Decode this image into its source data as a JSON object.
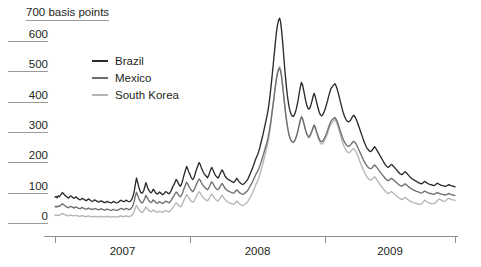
{
  "chart_data": {
    "type": "line",
    "title": "700 basis points",
    "xlabel": "",
    "ylabel": "basis points",
    "unit_label": "700 basis points",
    "ylim": [
      0,
      700
    ],
    "yticks": [
      0,
      100,
      200,
      300,
      400,
      500,
      600
    ],
    "ytick_labels": [
      "0",
      "100",
      "200",
      "300",
      "400",
      "500",
      "600"
    ],
    "grid": false,
    "legend_position": "upper-left-inside",
    "xlim": [
      "2006-01",
      "2009-12"
    ],
    "xticks": [
      "2007",
      "2008",
      "2009"
    ],
    "xtick_labels": [
      "2007",
      "2008",
      "2009"
    ],
    "x_boundaries": [
      "2006-01",
      "2007-01",
      "2008-01",
      "2009-01",
      "2009-12"
    ],
    "series": [
      {
        "name": "Brazil",
        "color": "#2b2b2b",
        "values": [
          82,
          84,
          80,
          86,
          83,
          88,
          92,
          97,
          94,
          90,
          86,
          84,
          81,
          79,
          83,
          86,
          84,
          81,
          78,
          80,
          83,
          80,
          77,
          75,
          73,
          75,
          78,
          76,
          74,
          72,
          70,
          73,
          76,
          74,
          71,
          69,
          68,
          70,
          73,
          71,
          69,
          67,
          66,
          68,
          70,
          68,
          66,
          65,
          64,
          66,
          68,
          66,
          65,
          64,
          63,
          65,
          68,
          66,
          64,
          63,
          64,
          66,
          69,
          72,
          70,
          68,
          67,
          69,
          72,
          70,
          68,
          67,
          68,
          72,
          78,
          88,
          104,
          126,
          145,
          133,
          118,
          106,
          98,
          95,
          97,
          104,
          116,
          130,
          120,
          110,
          104,
          99,
          96,
          100,
          108,
          104,
          98,
          94,
          92,
          95,
          99,
          96,
          93,
          90,
          92,
          96,
          100,
          98,
          95,
          93,
          96,
          102,
          110,
          118,
          124,
          132,
          140,
          136,
          128,
          122,
          118,
          124,
          134,
          148,
          160,
          172,
          183,
          176,
          166,
          158,
          150,
          144,
          140,
          146,
          156,
          168,
          178,
          188,
          196,
          190,
          180,
          172,
          164,
          158,
          154,
          150,
          146,
          152,
          162,
          172,
          180,
          174,
          166,
          158,
          152,
          148,
          145,
          150,
          158,
          166,
          172,
          166,
          158,
          150,
          146,
          142,
          140,
          138,
          136,
          134,
          132,
          130,
          133,
          138,
          144,
          140,
          134,
          130,
          127,
          125,
          124,
          126,
          130,
          134,
          138,
          144,
          152,
          160,
          168,
          176,
          186,
          196,
          206,
          214,
          222,
          232,
          244,
          258,
          272,
          286,
          302,
          318,
          334,
          350,
          368,
          392,
          420,
          452,
          486,
          520,
          556,
          592,
          624,
          648,
          664,
          672,
          660,
          630,
          592,
          548,
          504,
          466,
          432,
          404,
          382,
          366,
          356,
          350,
          348,
          352,
          360,
          372,
          388,
          406,
          428,
          446,
          460,
          452,
          436,
          418,
          400,
          386,
          376,
          372,
          376,
          386,
          398,
          412,
          424,
          416,
          402,
          388,
          374,
          362,
          354,
          350,
          352,
          358,
          366,
          376,
          388,
          400,
          414,
          426,
          438,
          444,
          448,
          452,
          456,
          450,
          440,
          428,
          414,
          400,
          386,
          372,
          360,
          350,
          342,
          336,
          332,
          330,
          332,
          336,
          342,
          348,
          352,
          348,
          342,
          334,
          324,
          314,
          304,
          294,
          284,
          274,
          264,
          256,
          248,
          242,
          238,
          234,
          232,
          234,
          238,
          244,
          248,
          244,
          238,
          232,
          226,
          220,
          214,
          208,
          202,
          196,
          190,
          186,
          182,
          180,
          182,
          186,
          190,
          188,
          184,
          180,
          176,
          172,
          168,
          164,
          160,
          158,
          156,
          158,
          162,
          166,
          164,
          160,
          156,
          152,
          148,
          145,
          142,
          140,
          138,
          136,
          134,
          132,
          130,
          128,
          127,
          126,
          128,
          131,
          134,
          132,
          129,
          127,
          125,
          124,
          123,
          122,
          121,
          120,
          122,
          125,
          128,
          126,
          124,
          122,
          121,
          120,
          119,
          118,
          118,
          119,
          121,
          123,
          122,
          120,
          119,
          118,
          117,
          116
        ]
      },
      {
        "name": "Mexico",
        "color": "#6e6e6e",
        "values": [
          50,
          52,
          49,
          53,
          51,
          54,
          57,
          60,
          58,
          55,
          52,
          50,
          48,
          47,
          50,
          52,
          50,
          48,
          46,
          48,
          50,
          48,
          46,
          45,
          44,
          46,
          48,
          46,
          44,
          43,
          42,
          44,
          46,
          44,
          43,
          42,
          41,
          43,
          45,
          43,
          42,
          41,
          40,
          42,
          44,
          42,
          41,
          40,
          39,
          41,
          43,
          41,
          40,
          39,
          38,
          40,
          42,
          40,
          39,
          38,
          39,
          41,
          43,
          45,
          44,
          42,
          41,
          43,
          45,
          44,
          42,
          41,
          42,
          45,
          50,
          58,
          70,
          86,
          98,
          90,
          80,
          72,
          66,
          63,
          64,
          70,
          78,
          88,
          82,
          75,
          70,
          66,
          64,
          67,
          73,
          70,
          66,
          63,
          62,
          64,
          67,
          65,
          63,
          61,
          63,
          66,
          69,
          67,
          65,
          63,
          66,
          70,
          76,
          82,
          87,
          93,
          99,
          96,
          90,
          86,
          83,
          88,
          95,
          105,
          114,
          123,
          131,
          126,
          119,
          113,
          107,
          103,
          100,
          105,
          112,
          121,
          129,
          136,
          142,
          138,
          131,
          125,
          119,
          115,
          112,
          109,
          106,
          111,
          118,
          126,
          132,
          128,
          122,
          116,
          111,
          108,
          106,
          110,
          116,
          122,
          127,
          122,
          116,
          110,
          107,
          104,
          102,
          100,
          99,
          97,
          96,
          95,
          98,
          102,
          106,
          103,
          99,
          96,
          94,
          92,
          91,
          93,
          96,
          99,
          102,
          107,
          113,
          119,
          125,
          131,
          139,
          147,
          155,
          161,
          167,
          175,
          184,
          194,
          205,
          216,
          228,
          240,
          252,
          264,
          278,
          296,
          317,
          341,
          367,
          393,
          420,
          447,
          471,
          490,
          501,
          507,
          498,
          476,
          447,
          414,
          381,
          352,
          326,
          305,
          288,
          276,
          269,
          264,
          263,
          266,
          272,
          281,
          293,
          307,
          323,
          337,
          347,
          341,
          329,
          316,
          302,
          292,
          284,
          281,
          284,
          292,
          301,
          311,
          320,
          314,
          304,
          293,
          283,
          274,
          268,
          265,
          266,
          271,
          277,
          284,
          293,
          302,
          313,
          322,
          331,
          336,
          339,
          342,
          345,
          340,
          333,
          324,
          313,
          302,
          292,
          281,
          272,
          265,
          259,
          254,
          251,
          249,
          251,
          254,
          259,
          263,
          266,
          263,
          259,
          253,
          245,
          237,
          230,
          222,
          215,
          207,
          200,
          194,
          188,
          183,
          180,
          177,
          176,
          177,
          180,
          185,
          188,
          185,
          180,
          176,
          171,
          167,
          162,
          158,
          153,
          149,
          144,
          141,
          138,
          136,
          138,
          141,
          144,
          142,
          139,
          136,
          133,
          130,
          127,
          124,
          121,
          120,
          118,
          120,
          123,
          126,
          124,
          121,
          118,
          115,
          112,
          110,
          108,
          106,
          104,
          103,
          101,
          100,
          99,
          97,
          96,
          96,
          97,
          100,
          102,
          100,
          98,
          97,
          95,
          94,
          94,
          93,
          92,
          91,
          93,
          95,
          97,
          96,
          94,
          93,
          92,
          91,
          90,
          90,
          89,
          90,
          92,
          94,
          93,
          91,
          90,
          89,
          88,
          88
        ]
      },
      {
        "name": "South Korea",
        "color": "#b5b5b5",
        "values": [
          22,
          23,
          21,
          23,
          22,
          24,
          26,
          28,
          27,
          25,
          23,
          22,
          21,
          20,
          22,
          23,
          22,
          21,
          20,
          21,
          22,
          21,
          20,
          19,
          19,
          20,
          21,
          20,
          19,
          18,
          18,
          19,
          20,
          19,
          18,
          18,
          17,
          18,
          19,
          18,
          18,
          17,
          17,
          18,
          19,
          18,
          17,
          17,
          17,
          18,
          19,
          18,
          17,
          17,
          16,
          17,
          18,
          17,
          17,
          16,
          17,
          18,
          19,
          20,
          19,
          18,
          18,
          19,
          20,
          19,
          18,
          18,
          19,
          21,
          24,
          29,
          37,
          47,
          55,
          49,
          43,
          38,
          34,
          32,
          33,
          37,
          43,
          50,
          46,
          41,
          38,
          35,
          34,
          36,
          40,
          38,
          35,
          33,
          32,
          34,
          36,
          35,
          33,
          32,
          33,
          36,
          38,
          36,
          35,
          33,
          36,
          39,
          44,
          49,
          53,
          58,
          63,
          60,
          56,
          53,
          50,
          54,
          60,
          68,
          75,
          83,
          90,
          86,
          80,
          75,
          70,
          67,
          65,
          69,
          75,
          82,
          89,
          95,
          100,
          96,
          90,
          85,
          80,
          77,
          74,
          72,
          70,
          74,
          80,
          87,
          92,
          88,
          83,
          78,
          74,
          71,
          69,
          73,
          78,
          84,
          88,
          84,
          78,
          73,
          70,
          67,
          65,
          63,
          62,
          60,
          59,
          58,
          61,
          65,
          69,
          66,
          62,
          59,
          57,
          55,
          54,
          56,
          59,
          62,
          65,
          70,
          76,
          82,
          88,
          95,
          103,
          112,
          121,
          128,
          135,
          144,
          154,
          166,
          179,
          192,
          206,
          220,
          234,
          248,
          264,
          284,
          307,
          333,
          361,
          389,
          418,
          447,
          473,
          494,
          506,
          513,
          504,
          482,
          452,
          419,
          386,
          356,
          329,
          307,
          290,
          277,
          269,
          264,
          262,
          265,
          271,
          280,
          292,
          306,
          322,
          336,
          346,
          340,
          328,
          314,
          300,
          289,
          281,
          277,
          280,
          288,
          297,
          307,
          316,
          310,
          299,
          288,
          277,
          268,
          261,
          257,
          258,
          262,
          268,
          275,
          283,
          292,
          303,
          312,
          321,
          326,
          330,
          334,
          338,
          332,
          324,
          314,
          302,
          290,
          278,
          266,
          256,
          248,
          241,
          235,
          231,
          228,
          229,
          232,
          236,
          240,
          242,
          238,
          233,
          226,
          217,
          208,
          199,
          190,
          182,
          173,
          166,
          159,
          152,
          147,
          143,
          140,
          138,
          139,
          142,
          146,
          149,
          145,
          140,
          135,
          130,
          125,
          120,
          116,
          111,
          107,
          102,
          99,
          96,
          94,
          95,
          98,
          100,
          98,
          95,
          92,
          89,
          86,
          83,
          80,
          78,
          76,
          74,
          75,
          78,
          81,
          79,
          76,
          74,
          71,
          69,
          67,
          66,
          64,
          63,
          62,
          61,
          60,
          59,
          58,
          58,
          60,
          64,
          68,
          72,
          70,
          67,
          65,
          63,
          62,
          61,
          60,
          60,
          61,
          63,
          66,
          70,
          73,
          76,
          74,
          72,
          70,
          69,
          68,
          70,
          73,
          76,
          78,
          77,
          75,
          74,
          73,
          72,
          71
        ]
      }
    ]
  },
  "legend": {
    "items": [
      {
        "label": "Brazil",
        "color": "#2b2b2b"
      },
      {
        "label": "Mexico",
        "color": "#6e6e6e"
      },
      {
        "label": "South Korea",
        "color": "#b5b5b5"
      }
    ]
  }
}
